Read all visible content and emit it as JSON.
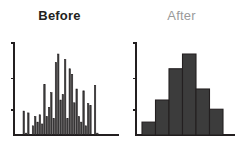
{
  "figure": {
    "background_color": "#ffffff",
    "bar_fill_color": "#3c3c3c",
    "bar_stroke_color": "#231f20",
    "axis_color": "#231f20",
    "title_color_before": "#231f20",
    "title_color_after": "#9a9a9a"
  },
  "panels": {
    "before": {
      "title": "Before"
    },
    "after": {
      "title": "After"
    }
  },
  "chart_data": [
    {
      "type": "bar",
      "title": "Before",
      "xlabel": "",
      "ylabel": "",
      "grid": false,
      "legend": null,
      "axis_ticks_y_count": 3,
      "ylim": [
        0,
        100
      ],
      "categories": [
        "1",
        "2",
        "3",
        "4",
        "5",
        "6",
        "7",
        "8",
        "9",
        "10",
        "11",
        "12",
        "13",
        "14",
        "15",
        "16",
        "17",
        "18",
        "19",
        "20",
        "21",
        "22",
        "23",
        "24",
        "25",
        "26",
        "27",
        "28",
        "29",
        "30",
        "31",
        "32",
        "33",
        "34",
        "35",
        "36",
        "37",
        "38",
        "39",
        "40"
      ],
      "values": [
        0,
        0,
        26,
        2,
        24,
        0,
        10,
        20,
        14,
        22,
        12,
        55,
        20,
        30,
        46,
        18,
        79,
        88,
        38,
        44,
        82,
        18,
        72,
        66,
        35,
        50,
        20,
        14,
        48,
        10,
        34,
        32,
        0,
        54,
        2,
        0,
        0,
        0,
        0,
        0
      ]
    },
    {
      "type": "bar",
      "title": "After",
      "xlabel": "",
      "ylabel": "",
      "grid": false,
      "legend": null,
      "axis_ticks_y_count": 3,
      "ylim": [
        0,
        100
      ],
      "categories": [
        "bin1",
        "bin2",
        "bin3",
        "bin4",
        "bin5",
        "bin6"
      ],
      "values": [
        14,
        38,
        72,
        88,
        50,
        28
      ]
    }
  ]
}
